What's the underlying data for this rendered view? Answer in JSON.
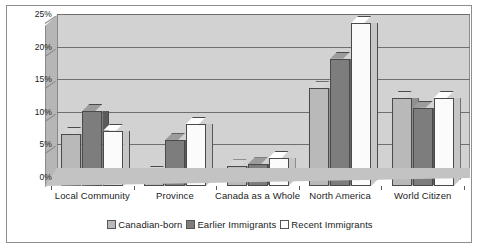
{
  "chart_data": {
    "type": "bar",
    "title": "",
    "subtitle": "",
    "xlabel": "",
    "ylabel": "",
    "categories": [
      "Local Community",
      "Province",
      "Canada as a Whole",
      "North America",
      "World Citizen"
    ],
    "series": [
      {
        "name": "Canadian-born",
        "color": "#b9b9b9",
        "values": [
          8.0,
          2.0,
          3.0,
          15.0,
          13.5
        ]
      },
      {
        "name": "Earlier Immigrants",
        "color": "#7d7d7d",
        "values": [
          11.5,
          7.0,
          3.3,
          19.5,
          12.0
        ]
      },
      {
        "name": "Recent Immigrants",
        "color": "#ffffff",
        "values": [
          8.5,
          9.5,
          4.3,
          25.0,
          13.5
        ]
      }
    ],
    "ylim": [
      0,
      25
    ],
    "ytick_values": [
      0,
      5,
      10,
      15,
      20,
      25
    ],
    "ytick_labels": [
      "0%",
      "5%",
      "10%",
      "15%",
      "20%",
      "25%"
    ],
    "grid": true,
    "legend_position": "bottom",
    "style": "3d-bar",
    "units": "percent"
  },
  "legend": {
    "items": [
      {
        "label": "Canadian-born"
      },
      {
        "label": "Earlier Immigrants"
      },
      {
        "label": "Recent Immigrants"
      }
    ]
  }
}
